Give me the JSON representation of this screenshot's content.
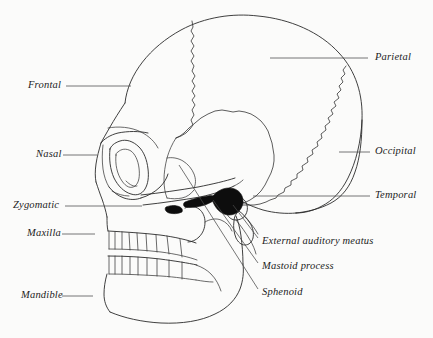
{
  "figure": {
    "background_color": "#fbfbfa",
    "line_color": "#2a2a2a",
    "label_style": "italic-serif"
  },
  "labels": {
    "frontal": "Frontal",
    "nasal": "Nasal",
    "zygomatic": "Zygomatic",
    "maxilla": "Maxilla",
    "mandible": "Mandible",
    "parietal": "Parietal",
    "occipital": "Occipital",
    "temporal": "Temporal",
    "external_auditory_meatus": "External auditory meatus",
    "mastoid_process": "Mastoid process",
    "sphenoid": "Sphenoid"
  },
  "callouts": [
    {
      "id": "frontal",
      "label": "Frontal",
      "side": "left",
      "x": 28,
      "y": 80
    },
    {
      "id": "nasal",
      "label": "Nasal",
      "side": "left",
      "x": 36,
      "y": 148
    },
    {
      "id": "zygomatic",
      "label": "Zygomatic",
      "side": "left",
      "x": 14,
      "y": 200
    },
    {
      "id": "maxilla",
      "label": "Maxilla",
      "side": "left",
      "x": 28,
      "y": 228
    },
    {
      "id": "mandible",
      "label": "Mandible",
      "side": "left",
      "x": 22,
      "y": 290
    },
    {
      "id": "parietal",
      "label": "Parietal",
      "side": "right",
      "x": 375,
      "y": 52
    },
    {
      "id": "occipital",
      "label": "Occipital",
      "side": "right",
      "x": 375,
      "y": 146
    },
    {
      "id": "temporal",
      "label": "Temporal",
      "side": "right",
      "x": 375,
      "y": 190
    },
    {
      "id": "external-auditory-meatus",
      "label": "External auditory meatus",
      "side": "right",
      "x": 262,
      "y": 241
    },
    {
      "id": "mastoid-process",
      "label": "Mastoid process",
      "side": "right",
      "x": 262,
      "y": 266
    },
    {
      "id": "sphenoid",
      "label": "Sphenoid",
      "side": "right",
      "x": 262,
      "y": 292
    }
  ],
  "anatomy_parts": [
    "cranial-vault",
    "frontal-bone",
    "parietal-bone",
    "occipital-bone",
    "temporal-squama",
    "coronal-suture",
    "lambdoid-suture",
    "squamosal-suture",
    "orbit",
    "nasal-aperture",
    "zygomatic-arch",
    "maxilla-teeth-row",
    "mandible-teeth-row",
    "mandibular-ramus",
    "external-auditory-meatus",
    "mastoid-process",
    "styloid-process",
    "sphenoid-greater-wing"
  ]
}
